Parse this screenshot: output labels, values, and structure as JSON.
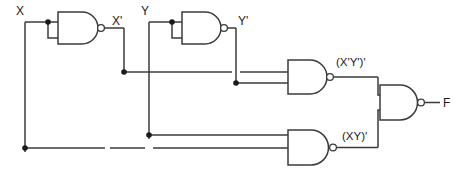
{
  "diagram": {
    "type": "logic-circuit",
    "line_color": "#3b3b3b",
    "label_color": "#1a1a1a",
    "background": "#ffffff"
  },
  "inputs": [
    {
      "id": "x",
      "label": "X"
    },
    {
      "id": "y",
      "label": "Y"
    }
  ],
  "outputs": [
    {
      "id": "f",
      "label": "F"
    }
  ],
  "signals": [
    {
      "id": "x-not",
      "label": "X'"
    },
    {
      "id": "y-not",
      "label": "Y'"
    },
    {
      "id": "xnot-ynot-nand",
      "label": "(X'Y')'"
    },
    {
      "id": "xy-nand",
      "label": "(XY)'"
    }
  ],
  "gates": [
    {
      "id": "nand-inverter-x",
      "type": "NAND",
      "role": "inverter",
      "inputs": [
        "X",
        "X"
      ],
      "output": "X'"
    },
    {
      "id": "nand-inverter-y",
      "type": "NAND",
      "role": "inverter",
      "inputs": [
        "Y",
        "Y"
      ],
      "output": "Y'"
    },
    {
      "id": "nand-xnot-ynot",
      "type": "NAND",
      "role": "combiner",
      "inputs": [
        "X'",
        "Y'"
      ],
      "output": "(X'Y')'"
    },
    {
      "id": "nand-x-y",
      "type": "NAND",
      "role": "combiner",
      "inputs": [
        "X",
        "Y"
      ],
      "output": "(XY)'"
    },
    {
      "id": "nand-output",
      "type": "NAND",
      "role": "output",
      "inputs": [
        "(X'Y')'",
        "(XY)'"
      ],
      "output": "F"
    }
  ]
}
